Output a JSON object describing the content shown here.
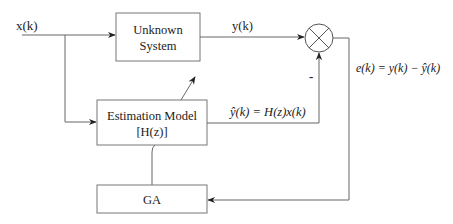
{
  "diagram": {
    "input_label": "x(k)",
    "output_label": "y(k)",
    "blocks": {
      "unknown_system": {
        "line1": "Unknown",
        "line2": "System"
      },
      "estimation_model": {
        "line1": "Estimation Model",
        "line2": "[H(z)]"
      },
      "ga": {
        "label": "GA"
      }
    },
    "summing_junction": {
      "minus_sign": "-"
    },
    "estimate_equation": "ŷ(k) = H(z)x(k)",
    "error_equation": "e(k) = y(k) − ŷ(k)",
    "colors": {
      "line": "#555555",
      "text": "#222222",
      "background": "#ffffff"
    }
  }
}
